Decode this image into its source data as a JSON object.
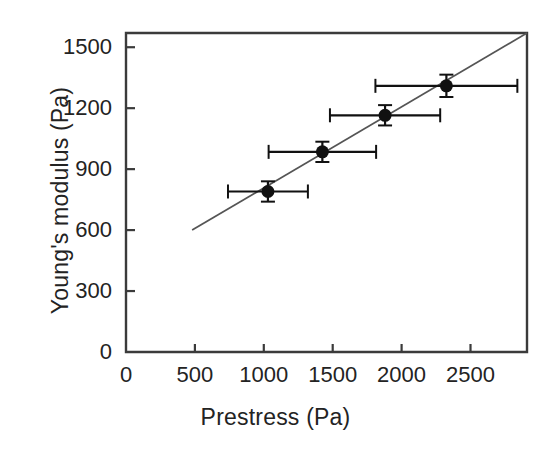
{
  "chart_data": {
    "type": "scatter",
    "title": "",
    "xlabel": "Prestress (Pa)",
    "ylabel": "Young's modulus (Pa)",
    "xlim": [
      0,
      2910
    ],
    "ylim": [
      0,
      1570
    ],
    "xticks": [
      0,
      500,
      1000,
      1500,
      2000,
      2500
    ],
    "xticklabels": [
      "0",
      "500",
      "1000",
      "1500",
      "2000",
      "2500"
    ],
    "yticks": [
      0,
      300,
      600,
      900,
      1200,
      1500
    ],
    "yticklabels": [
      "0",
      "300",
      "600",
      "900",
      "1200",
      "1500"
    ],
    "grid": false,
    "legend": null,
    "marker": "filled-circle",
    "marker_color": "#111111",
    "line_color": "#555555",
    "points": [
      {
        "x": 1030,
        "y": 790,
        "xerr": 290,
        "yerr": 50
      },
      {
        "x": 1425,
        "y": 985,
        "xerr": 390,
        "yerr": 50
      },
      {
        "x": 1880,
        "y": 1165,
        "xerr": 400,
        "yerr": 50
      },
      {
        "x": 2325,
        "y": 1310,
        "xerr": 515,
        "yerr": 55
      }
    ],
    "fit_line": {
      "x_start": 480,
      "y_start": 600,
      "x_end": 2910,
      "y_end": 1570
    }
  },
  "axes": {
    "x_title": "Prestress (Pa)",
    "y_title": "Young's modulus (Pa)"
  }
}
